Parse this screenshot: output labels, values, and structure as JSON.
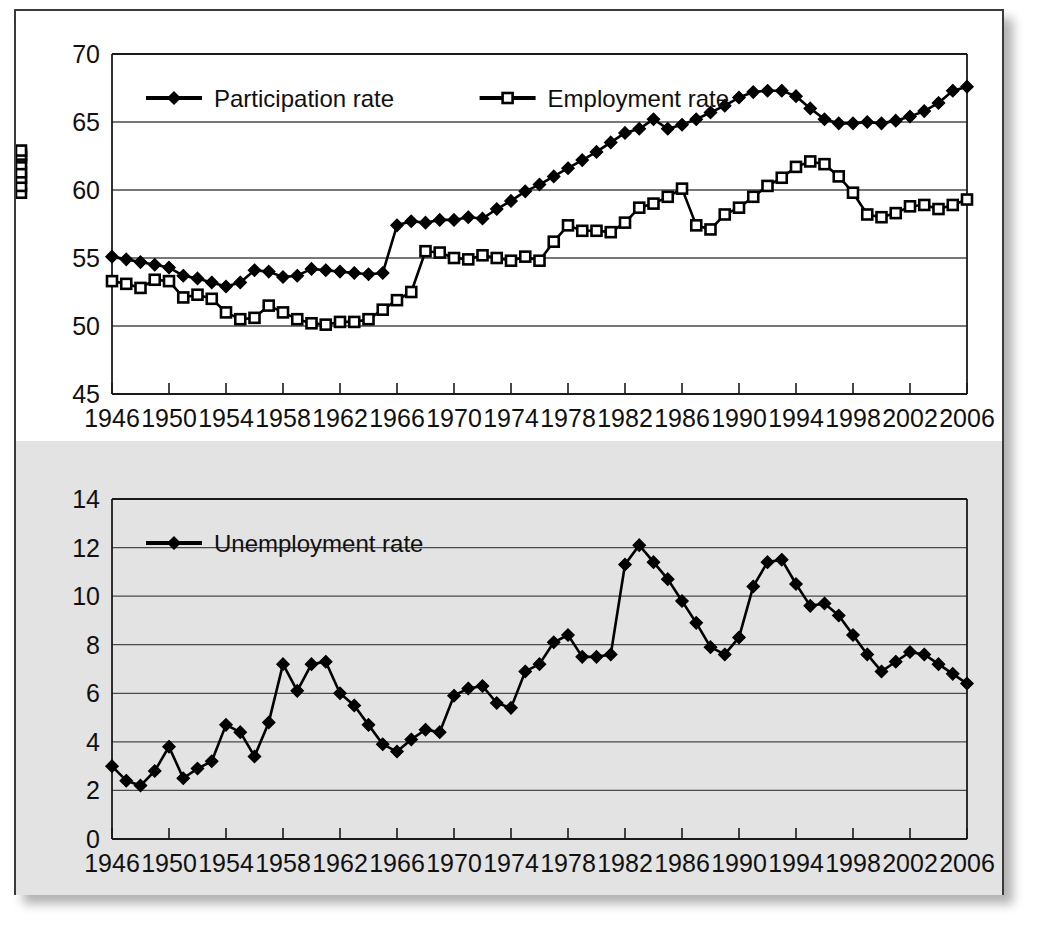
{
  "chart_data": [
    {
      "type": "line",
      "title": "",
      "xlabel": "",
      "ylabel": "",
      "xlim": [
        1946,
        2006
      ],
      "ylim": [
        45,
        70
      ],
      "yticks": [
        45,
        50,
        55,
        60,
        65,
        70
      ],
      "xticks": [
        1946,
        1950,
        1954,
        1958,
        1962,
        1966,
        1970,
        1974,
        1978,
        1982,
        1986,
        1990,
        1994,
        1998,
        2002,
        2006
      ],
      "xtick_labels": [
        "1946",
        "1950",
        "1954",
        "1958",
        "1962",
        "1966",
        "1970",
        "1974",
        "1978",
        "1982",
        "1986",
        "1990",
        "1994",
        "1998",
        "2002",
        "2006"
      ],
      "ytick_labels": [
        "45",
        "50",
        "55",
        "60",
        "65",
        "70"
      ],
      "grid": true,
      "legend_position": "top-left-inside",
      "x": [
        1946,
        1947,
        1948,
        1949,
        1950,
        1951,
        1952,
        1953,
        1954,
        1955,
        1956,
        1957,
        1958,
        1959,
        1960,
        1961,
        1962,
        1963,
        1964,
        1965,
        1966,
        1967,
        1968,
        1969,
        1970,
        1971,
        1972,
        1973,
        1974,
        1975,
        1976,
        1977,
        1978,
        1979,
        1980,
        1981,
        1982,
        1983,
        1984,
        1985,
        1986,
        1987,
        1988,
        1989,
        1990,
        1991,
        1992,
        1993,
        1994,
        1995,
        1996,
        1997,
        1998,
        1999,
        2000,
        2001,
        2002,
        2003,
        2004,
        2005,
        2006
      ],
      "series": [
        {
          "name": "Participation rate",
          "marker": "filled-diamond",
          "values": [
            55.1,
            54.9,
            54.7,
            54.5,
            54.3,
            53.7,
            53.5,
            53.2,
            52.9,
            53.2,
            54.1,
            54.0,
            53.6,
            53.7,
            54.2,
            54.1,
            54.0,
            53.9,
            53.8,
            53.9,
            57.4,
            57.7,
            57.6,
            57.8,
            57.8,
            58.0,
            57.9,
            58.6,
            59.2,
            59.9,
            60.4,
            61.0,
            61.6,
            62.2,
            62.8,
            63.5,
            64.2,
            64.5,
            65.2,
            64.5,
            64.8,
            65.2,
            65.7,
            66.2,
            66.8,
            67.2,
            67.3,
            67.3,
            66.9,
            66.0,
            65.2,
            64.9,
            64.9,
            65.0,
            64.9,
            65.1,
            65.4,
            65.8,
            66.4,
            67.3,
            67.6,
            67.2
          ]
        },
        {
          "name": "Employment rate",
          "marker": "open-square",
          "values": [
            53.3,
            53.1,
            52.8,
            53.4,
            53.3,
            52.1,
            52.3,
            52.0,
            51.0,
            50.5,
            50.6,
            51.5,
            51.0,
            50.5,
            50.2,
            50.1,
            50.3,
            50.3,
            50.5,
            51.2,
            51.9,
            52.5,
            55.5,
            55.4,
            55.0,
            54.9,
            55.2,
            55.0,
            54.8,
            55.1,
            54.8,
            56.2,
            57.4,
            57.0,
            57.0,
            56.9,
            57.6,
            58.7,
            59.0,
            59.5,
            60.1,
            57.4,
            57.1,
            58.2,
            58.7,
            59.5,
            60.3,
            60.9,
            61.7,
            62.1,
            61.9,
            61.0,
            59.8,
            58.2,
            58.0,
            58.3,
            58.8,
            58.9,
            58.6,
            58.9,
            59.3,
            59.8,
            60.3,
            60.9,
            61.3,
            61.9,
            62.4,
            62.6,
            62.9
          ]
        }
      ]
    },
    {
      "type": "line",
      "title": "",
      "xlabel": "",
      "ylabel": "",
      "xlim": [
        1946,
        2006
      ],
      "ylim": [
        0,
        14
      ],
      "yticks": [
        0,
        2,
        4,
        6,
        8,
        10,
        12,
        14
      ],
      "xticks": [
        1946,
        1950,
        1954,
        1958,
        1962,
        1966,
        1970,
        1974,
        1978,
        1982,
        1986,
        1990,
        1994,
        1998,
        2002,
        2006
      ],
      "xtick_labels": [
        "1946",
        "1950",
        "1954",
        "1958",
        "1962",
        "1966",
        "1970",
        "1974",
        "1978",
        "1982",
        "1986",
        "1990",
        "1994",
        "1998",
        "2002",
        "2006"
      ],
      "ytick_labels": [
        "0",
        "2",
        "4",
        "6",
        "8",
        "10",
        "12",
        "14"
      ],
      "grid": true,
      "legend_position": "top-left-inside",
      "x": [
        1946,
        1947,
        1948,
        1949,
        1950,
        1951,
        1952,
        1953,
        1954,
        1955,
        1956,
        1957,
        1958,
        1959,
        1960,
        1961,
        1962,
        1963,
        1964,
        1965,
        1966,
        1967,
        1968,
        1969,
        1970,
        1971,
        1972,
        1973,
        1974,
        1975,
        1976,
        1977,
        1978,
        1979,
        1980,
        1981,
        1982,
        1983,
        1984,
        1985,
        1986,
        1987,
        1988,
        1989,
        1990,
        1991,
        1992,
        1993,
        1994,
        1995,
        1996,
        1997,
        1998,
        1999,
        2000,
        2001,
        2002,
        2003,
        2004,
        2005,
        2006
      ],
      "series": [
        {
          "name": "Unemployment rate",
          "marker": "filled-diamond",
          "values": [
            3.0,
            2.4,
            2.2,
            2.8,
            3.8,
            2.5,
            2.9,
            3.2,
            4.7,
            4.4,
            3.4,
            4.8,
            7.2,
            6.1,
            7.2,
            7.3,
            6.0,
            5.5,
            4.7,
            3.9,
            3.6,
            4.1,
            4.5,
            4.4,
            5.9,
            6.2,
            6.3,
            5.6,
            5.4,
            6.9,
            7.2,
            8.1,
            8.4,
            7.5,
            7.5,
            7.6,
            11.3,
            12.1,
            11.4,
            10.7,
            9.8,
            8.9,
            7.9,
            7.6,
            8.3,
            10.4,
            11.4,
            11.5,
            10.5,
            9.6,
            9.7,
            9.2,
            8.4,
            7.6,
            6.9,
            7.3,
            7.7,
            7.6,
            7.2,
            6.8,
            6.4
          ]
        }
      ]
    }
  ],
  "charts": [
    {
      "id": "top",
      "legend": [
        {
          "label": "Participation rate",
          "marker": "filled-diamond"
        },
        {
          "label": "Employment rate",
          "marker": "open-square"
        }
      ]
    },
    {
      "id": "bottom",
      "legend": [
        {
          "label": "Unemployment rate",
          "marker": "filled-diamond"
        }
      ]
    }
  ],
  "colors": {
    "series_line": "#000000",
    "gridline": "#4a4a4a",
    "axis": "#1a1a1a",
    "panel_border": "#3a3a3a",
    "panel_top_bg": "#ffffff",
    "panel_bottom_bg": "#e3e3e3",
    "text": "#101010"
  }
}
